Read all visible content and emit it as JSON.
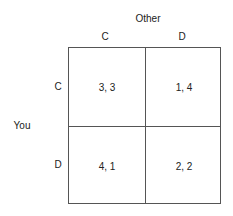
{
  "column_player": "Other",
  "row_player": "You",
  "columns": [
    "C",
    "D"
  ],
  "rows": [
    "C",
    "D"
  ],
  "payoffs": [
    [
      "3, 3",
      "1, 4"
    ],
    [
      "4, 1",
      "2, 2"
    ]
  ]
}
